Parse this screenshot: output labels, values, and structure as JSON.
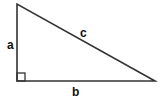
{
  "diagram": {
    "type": "right-triangle",
    "vertices": {
      "top": [
        17,
        4
      ],
      "right_angle": [
        17,
        81
      ],
      "right": [
        155,
        81
      ]
    },
    "labels": {
      "a": "a",
      "b": "b",
      "c": "c"
    },
    "colors": {
      "stroke": "#333333",
      "label": "#111111",
      "background": "#ffffff"
    }
  }
}
